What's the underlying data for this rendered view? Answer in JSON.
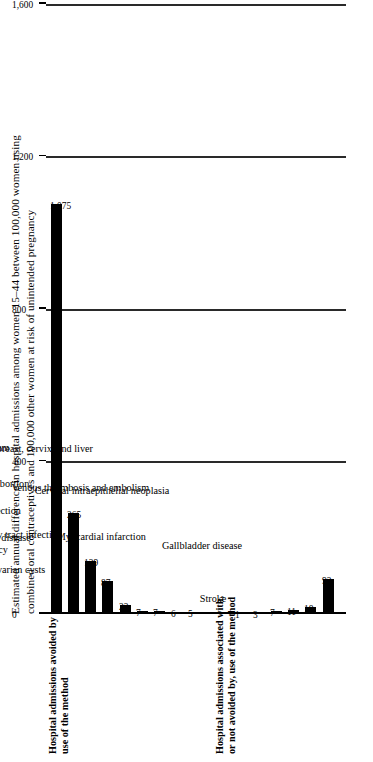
{
  "chart_data": {
    "type": "bar",
    "title": "Estimated annual difference in hospital admissions among women 15–44 between 100,000 women using combined oral contraceptives and 100,000 other women at risk of unintended pregnancy",
    "title_lines": [
      "Estimated annual difference in hospital admissions among women 15–44 between 100,000 women using",
      "combined oral contraceptives and 100,000 other women at risk of unintended pregnancy"
    ],
    "orientation": "horizontal",
    "xlabel": "",
    "ylabel": "",
    "xlim": [
      0,
      1600
    ],
    "grid": true,
    "legend": "none",
    "axis_ticks": [
      "0",
      "400",
      "800",
      "1,200",
      "1,600"
    ],
    "axis_tick_values": [
      0,
      400,
      800,
      1200,
      1600
    ],
    "bar_color": "#000000",
    "categories": [
      "Cesarean delivery",
      "Spontaneous abortion",
      "Ectopic pregnancy",
      "Ovarian cysts",
      "Benign breast disease",
      "Upper genital tract infection",
      "Urinary tract infection",
      "Complications of induced abortion",
      "Invasive cancers of ovary and endometrium",
      "Myocardial infarction",
      "Stroke",
      "Invasive cancers of breast, cervix, and liver",
      "Venous thrombosis and embolism",
      "Cervical intraepithelial neoplasia",
      "Gallbladder disease"
    ],
    "values": [
      1075,
      265,
      139,
      87,
      23,
      7,
      7,
      6,
      5,
      1,
      3,
      7,
      11,
      18,
      93
    ],
    "value_labels": [
      "1,075",
      "265",
      "139",
      "87",
      "23",
      "7",
      "7",
      "6",
      "5",
      "1",
      "3",
      "7",
      "11",
      "18",
      "93"
    ],
    "sections": [
      {
        "heading_lines": [
          "Hospital admissions avoided by",
          "use of the method"
        ],
        "heading": "Hospital admissions avoided by use of the method",
        "category_indices": [
          0,
          1,
          2,
          3,
          4,
          5,
          6,
          7,
          8
        ]
      },
      {
        "heading_lines": [
          "Hospital admissions associated with,",
          "or not avoided by, use of the method"
        ],
        "heading": "Hospital admissions associated with, or not avoided by, use of the method",
        "category_indices": [
          9,
          10,
          11,
          12,
          13,
          14
        ]
      }
    ]
  }
}
